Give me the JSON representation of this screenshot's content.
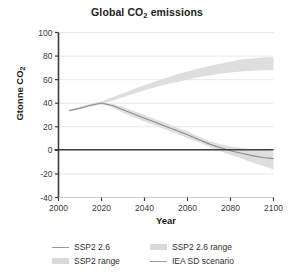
{
  "chart_data": {
    "type": "line",
    "title": "Global CO2 emissions",
    "title_parts": {
      "before": "Global CO",
      "sub": "2",
      "after": " emissions"
    },
    "xlabel": "Year",
    "ylabel": "Gtonne CO2",
    "ylabel_parts": {
      "before": "Gtonne CO",
      "sub": "2"
    },
    "xlim": [
      2000,
      2100
    ],
    "ylim": [
      -40,
      100
    ],
    "xticks": [
      2000,
      2020,
      2040,
      2060,
      2080,
      2100
    ],
    "xticklabels": [
      "2000",
      "2020",
      "2040",
      "2060",
      "2080",
      "2100"
    ],
    "yticks": [
      -40,
      -20,
      0,
      20,
      40,
      60,
      80,
      100
    ],
    "yticklabels": [
      "-40",
      "-20",
      "0",
      "20",
      "40",
      "60",
      "80",
      "100"
    ],
    "grid": "horizontal",
    "legend_position": "below",
    "zero_line": 0,
    "x": [
      2005,
      2010,
      2015,
      2020,
      2025,
      2030,
      2035,
      2040,
      2045,
      2050,
      2055,
      2060,
      2065,
      2070,
      2075,
      2080,
      2085,
      2090,
      2095,
      2100
    ],
    "series": [
      {
        "name": "SSP2 range",
        "kind": "band",
        "color": "#dcdcdc",
        "lower": [
          33.0,
          35.0,
          37.5,
          39.5,
          42.0,
          45.0,
          48.0,
          51.0,
          53.5,
          56.0,
          58.0,
          60.0,
          62.0,
          63.5,
          65.0,
          66.0,
          67.0,
          67.5,
          68.0,
          68.0
        ],
        "upper": [
          34.5,
          37.0,
          39.5,
          41.5,
          45.0,
          48.5,
          52.0,
          55.5,
          58.5,
          61.5,
          64.5,
          67.0,
          69.5,
          71.5,
          73.5,
          75.5,
          77.0,
          78.0,
          78.8,
          79.0
        ]
      },
      {
        "name": "SSP2 2.6 range",
        "kind": "band",
        "color": "#dcdcdc",
        "lower": [
          33.0,
          35.0,
          37.5,
          39.0,
          36.5,
          32.0,
          28.0,
          24.5,
          21.0,
          17.5,
          14.0,
          10.5,
          7.0,
          3.0,
          -0.5,
          -4.0,
          -7.0,
          -10.0,
          -13.0,
          -16.0
        ],
        "upper": [
          34.5,
          36.5,
          39.0,
          41.0,
          39.5,
          37.0,
          33.5,
          30.0,
          26.5,
          23.0,
          19.5,
          16.0,
          12.0,
          8.0,
          5.5,
          3.5,
          2.0,
          1.0,
          0.0,
          -1.0
        ]
      },
      {
        "name": "SSP2 2.6",
        "kind": "line",
        "color": "#8c8c8c",
        "values": [
          33.8,
          35.8,
          38.2,
          40.2,
          38.0,
          34.5,
          30.8,
          27.3,
          23.8,
          20.3,
          16.8,
          13.3,
          9.5,
          5.5,
          2.5,
          -0.3,
          -2.5,
          -4.5,
          -6.0,
          -7.0
        ]
      },
      {
        "name": "IEA SD scenario",
        "kind": "line",
        "color": "#404040",
        "values": [
          0.5,
          0.5,
          0.5,
          0.5,
          0.5,
          0.5,
          0.5,
          0.5,
          0.5,
          0.5,
          0.5,
          0.5,
          0.5,
          0.5,
          0.5,
          0.5,
          0.5,
          0.5,
          0.5,
          0.5
        ]
      }
    ],
    "legend": [
      {
        "label": "SSP2 2.6",
        "kind": "line",
        "color": "#9a9a9a"
      },
      {
        "label": "SSP2 2.6 range",
        "kind": "band",
        "color": "#d9d9d9"
      },
      {
        "label": "SSP2 range",
        "kind": "band",
        "color": "#d9d9d9"
      },
      {
        "label": "IEA SD scenario",
        "kind": "line",
        "color": "#8a8a8a"
      }
    ]
  },
  "colors": {
    "background": "#ffffff",
    "axis": "#3c3c3c",
    "grid": "#e8e8e8",
    "text": "#2b2b2b",
    "band": "#dcdcdc",
    "line_light": "#8c8c8c",
    "line_dark": "#404040"
  }
}
